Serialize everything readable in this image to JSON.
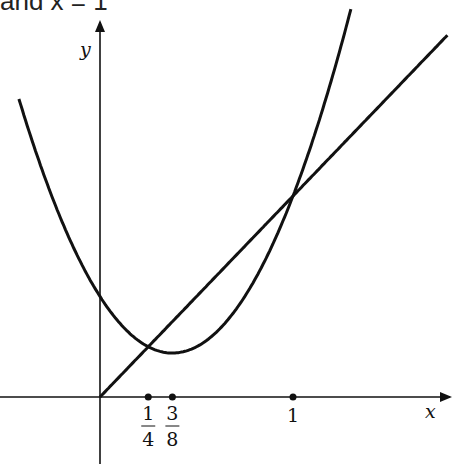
{
  "caption": "and x = 1",
  "chart_data": {
    "type": "line",
    "title": "",
    "xlabel": "x",
    "ylabel": "y",
    "x_ticks": [
      {
        "value": 0.25,
        "num": "1",
        "den": "4"
      },
      {
        "value": 0.375,
        "num": "3",
        "den": "8"
      },
      {
        "value": 1,
        "label": "1"
      }
    ],
    "series": [
      {
        "name": "parabola",
        "expression": "y = 2x^2 - 1.5x + 0.5",
        "x_range": [
          -0.42,
          1.3
        ],
        "vertex": [
          0.375,
          0.21875
        ],
        "y_intercept": 0.5
      },
      {
        "name": "line",
        "expression": "y = x",
        "x_range": [
          0,
          1.8
        ]
      }
    ],
    "intersections": [
      [
        0.25,
        0.25
      ],
      [
        1,
        1
      ]
    ],
    "xlim": [
      -0.52,
      1.85
    ],
    "ylim": [
      -0.25,
      1.95
    ],
    "grid": false,
    "legend": "none"
  },
  "colors": {
    "stroke": "#111111",
    "background": "#ffffff"
  }
}
